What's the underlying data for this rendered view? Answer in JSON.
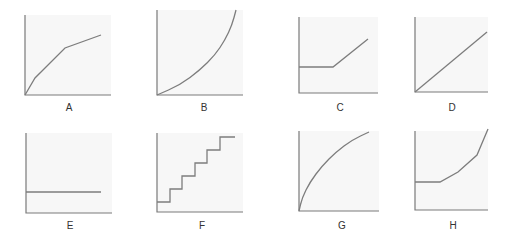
{
  "figure": {
    "panels": [
      {
        "id": "A",
        "label": "A",
        "shape": "piecewise concave (decreasing slope)",
        "origin": [
          25,
          95
        ],
        "x_end": 111,
        "y_top": 15,
        "path": [
          [
            25,
            95
          ],
          [
            35,
            78
          ],
          [
            65,
            48
          ],
          [
            101,
            35
          ]
        ],
        "label_pos": [
          69,
          111
        ]
      },
      {
        "id": "B",
        "label": "B",
        "shape": "convex increasing curve",
        "origin": [
          157,
          95
        ],
        "x_end": 243,
        "y_top": 10,
        "path": [
          [
            157,
            95
          ],
          [
            180,
            85
          ],
          [
            200,
            70
          ],
          [
            215,
            55
          ],
          [
            225,
            40
          ],
          [
            232,
            25
          ],
          [
            236,
            10
          ]
        ],
        "label_pos": [
          204,
          111
        ]
      },
      {
        "id": "C",
        "label": "C",
        "shape": "flat then linear increase",
        "origin": [
          299,
          93
        ],
        "x_end": 378,
        "y_top": 17,
        "path": [
          [
            299,
            67
          ],
          [
            333,
            67
          ],
          [
            368,
            39
          ]
        ],
        "label_pos": [
          340,
          111
        ]
      },
      {
        "id": "D",
        "label": "D",
        "shape": "straight line through origin",
        "origin": [
          415,
          92
        ],
        "x_end": 488,
        "y_top": 17,
        "path": [
          [
            415,
            92
          ],
          [
            487,
            32
          ]
        ],
        "label_pos": [
          452,
          111
        ]
      },
      {
        "id": "E",
        "label": "E",
        "shape": "horizontal constant line",
        "origin": [
          26,
          213
        ],
        "x_end": 112,
        "y_top": 133,
        "path": [
          [
            26,
            192
          ],
          [
            101,
            192
          ]
        ],
        "label_pos": [
          70,
          229
        ]
      },
      {
        "id": "F",
        "label": "F",
        "shape": "staircase step function",
        "origin": [
          157,
          212
        ],
        "x_end": 243,
        "y_top": 133,
        "path": [
          [
            157,
            202
          ],
          [
            170,
            202
          ],
          [
            170,
            189
          ],
          [
            182,
            189
          ],
          [
            182,
            176
          ],
          [
            195,
            176
          ],
          [
            195,
            163
          ],
          [
            207,
            163
          ],
          [
            207,
            150
          ],
          [
            220,
            150
          ],
          [
            220,
            137
          ],
          [
            235,
            137
          ]
        ],
        "label_pos": [
          202,
          229
        ]
      },
      {
        "id": "G",
        "label": "G",
        "shape": "concave increasing curve",
        "origin": [
          299,
          211
        ],
        "x_end": 379,
        "y_top": 131,
        "path": [
          [
            299,
            211
          ],
          [
            302,
            198
          ],
          [
            310,
            182
          ],
          [
            322,
            166
          ],
          [
            336,
            152
          ],
          [
            352,
            140
          ],
          [
            369,
            132
          ]
        ],
        "label_pos": [
          342,
          229
        ]
      },
      {
        "id": "H",
        "label": "H",
        "shape": "flat then accelerating increase",
        "origin": [
          415,
          210
        ],
        "x_end": 488,
        "y_top": 131,
        "path": [
          [
            415,
            182
          ],
          [
            440,
            182
          ],
          [
            458,
            172
          ],
          [
            477,
            155
          ],
          [
            488,
            129
          ]
        ],
        "label_pos": [
          453,
          229
        ]
      }
    ]
  },
  "colors": {
    "axis": "#7a7a7a",
    "curve": "#7d7d7d",
    "panel_background": "#f7f7f7",
    "label": "#333333"
  }
}
